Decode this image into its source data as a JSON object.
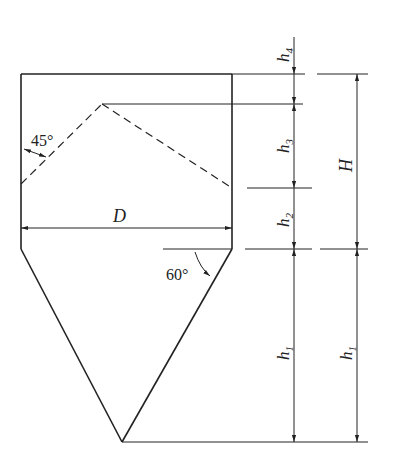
{
  "diagram": {
    "type": "hopper-silo-dimension-drawing",
    "labels": {
      "diameter": "D",
      "total_height": "H",
      "h1_left": "h",
      "h1_right": "h",
      "h1_sub": "1",
      "h2": "h",
      "h2_sub": "2",
      "h3": "h",
      "h3_sub": "3",
      "h4": "h",
      "h4_sub": "4",
      "angle_roof": "45°",
      "angle_cone": "60°"
    },
    "colors": {
      "line": "#222222",
      "background": "#ffffff"
    }
  }
}
